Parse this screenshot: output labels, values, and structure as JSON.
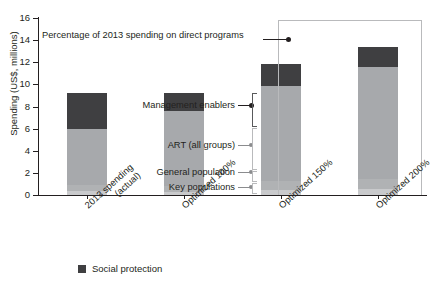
{
  "chart_data": {
    "type": "bar",
    "title": "",
    "subtitle": "",
    "xlabel": "",
    "ylabel": "Spending (US$, millions)",
    "ylim": [
      0,
      16
    ],
    "yticks": [
      0,
      2,
      4,
      6,
      8,
      10,
      12,
      14,
      16
    ],
    "grid": false,
    "legend_position": "bottom-left",
    "stacked": true,
    "categories": [
      "2013 spending (actual)",
      "Optimized 100%",
      "Optimized 150%",
      "Optimized 200%"
    ],
    "totals": [
      9.2,
      9.2,
      11.8,
      13.4
    ],
    "series": [
      {
        "name": "Key populations",
        "color": "#c9cacc",
        "values": [
          0.35,
          0.3,
          0.45,
          0.5
        ]
      },
      {
        "name": "General population",
        "color": "#b0b2b4",
        "values": [
          0.55,
          0.55,
          0.8,
          0.95
        ]
      },
      {
        "name": "ART (all groups)",
        "color": "#a7a9ac",
        "values": [
          5.1,
          6.7,
          8.6,
          10.1
        ]
      },
      {
        "name": "Management enablers",
        "color": "#3f3f41",
        "values": [
          3.2,
          1.65,
          1.95,
          1.85
        ]
      }
    ],
    "annotations": [
      {
        "text": "Percentage of 2013 spending on direct programs",
        "target": "frame-top-left"
      },
      {
        "text": "Management enablers",
        "target": "bar1-dark-block"
      },
      {
        "text": "ART (all groups)",
        "target": "bar1-art"
      },
      {
        "text": "General population",
        "target": "bar1-general"
      },
      {
        "text": "Key populations",
        "target": "bar1-key"
      }
    ],
    "legend": [
      {
        "label": "Social protection",
        "color": "#3f3f41"
      }
    ]
  },
  "axis": {
    "y_title": "Spending (US$, millions)",
    "y_tick_labels": [
      "16",
      "14",
      "12",
      "10",
      "8",
      "6",
      "4",
      "2",
      "0"
    ]
  },
  "callouts": {
    "percentage_note": "Percentage of 2013 spending on direct programs",
    "management_enablers": "Management enablers",
    "art_all_groups": "ART (all groups)",
    "general_population": "General population",
    "key_populations": "Key populations"
  },
  "x_labels": [
    {
      "line1": "2013 spending",
      "line2": "(actual)"
    },
    {
      "line1": "Optimized 100%",
      "line2": ""
    },
    {
      "line1": "Optimized 150%",
      "line2": ""
    },
    {
      "line1": "Optimized 200%",
      "line2": ""
    }
  ],
  "legend": {
    "items": [
      {
        "label": "Social protection",
        "color": "#3f3f41"
      }
    ]
  }
}
